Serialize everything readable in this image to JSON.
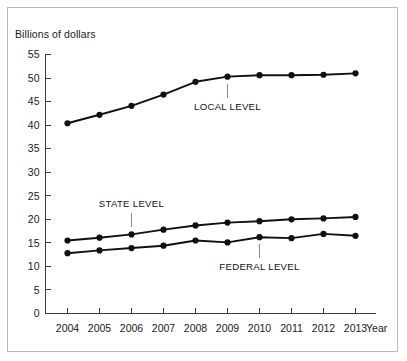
{
  "figure": {
    "y_axis_title": "Billions of dollars",
    "x_axis_name": "Year"
  },
  "chart_data": {
    "type": "line",
    "title": "",
    "subtitle": "",
    "xlabel": "Year",
    "ylabel": "Billions of dollars",
    "categories": [
      "2004",
      "2005",
      "2006",
      "2007",
      "2008",
      "2009",
      "2010",
      "2011",
      "2012",
      "2013"
    ],
    "x": [
      2004,
      2005,
      2006,
      2007,
      2008,
      2009,
      2010,
      2011,
      2012,
      2013
    ],
    "ylim": [
      0,
      55
    ],
    "ytick_labels": [
      "0",
      "5",
      "10",
      "15",
      "20",
      "25",
      "30",
      "35",
      "40",
      "45",
      "50",
      "55"
    ],
    "ytick_values": [
      0,
      5,
      10,
      15,
      20,
      25,
      30,
      35,
      40,
      45,
      50,
      55
    ],
    "grid": false,
    "legend_position": "inline-annotations",
    "series": [
      {
        "name": "LOCAL LEVEL",
        "values": [
          40.4,
          42.2,
          44.1,
          46.5,
          49.2,
          50.3,
          50.6,
          50.6,
          50.7,
          51.0
        ],
        "annotation_at": "2009",
        "annotation_side": "below"
      },
      {
        "name": "STATE LEVEL",
        "values": [
          15.5,
          16.1,
          16.8,
          17.8,
          18.7,
          19.3,
          19.6,
          20.0,
          20.2,
          20.5
        ],
        "annotation_at": "2006",
        "annotation_side": "above"
      },
      {
        "name": "FEDERAL LEVEL",
        "values": [
          12.8,
          13.4,
          13.9,
          14.4,
          15.5,
          15.1,
          16.2,
          16.0,
          16.9,
          16.5
        ],
        "annotation_at": "2010",
        "annotation_side": "below"
      }
    ]
  },
  "colors": {
    "series_line": "#101010",
    "axis": "#3a3a3a",
    "frame_border": "#b9b9b9",
    "text": "#1a1a1a",
    "leader": "#8a8a8a",
    "background": "#ffffff"
  }
}
